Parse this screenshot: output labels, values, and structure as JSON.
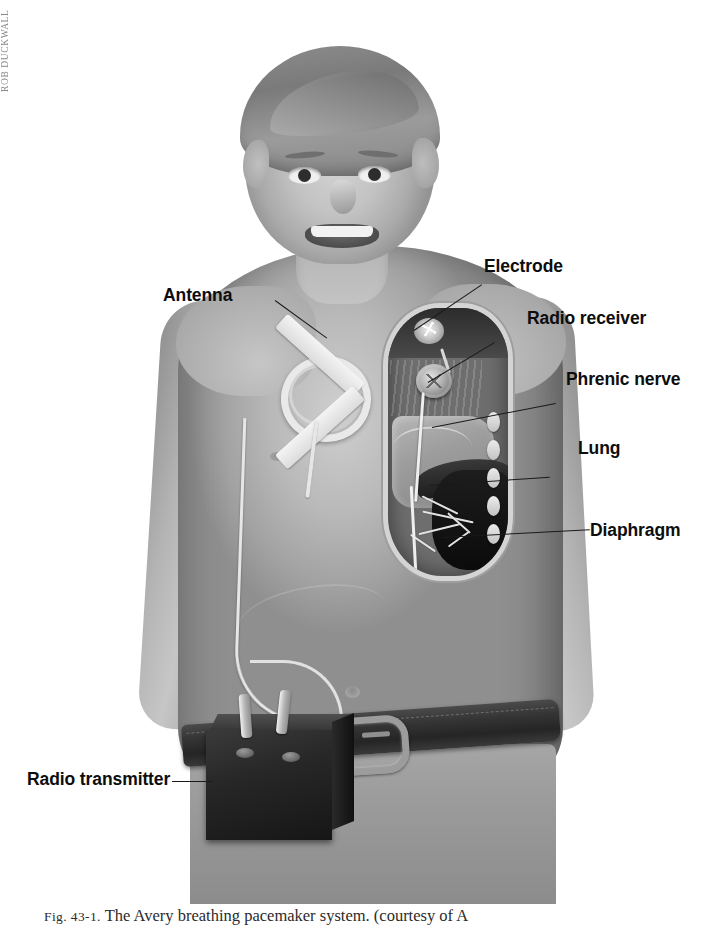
{
  "figure": {
    "alt_title": "Avery breathing pacemaker system",
    "caption_prefix": "Fig. 43-1.",
    "caption_text": "The Avery breathing pacemaker system. (courtesy of A",
    "artist_signature": "ROB DUCKWALL",
    "background_color": "#ffffff",
    "label_color": "#0d0d0d",
    "leader_color": "#1a1a1a"
  },
  "labels": [
    {
      "id": "antenna",
      "text": "Antenna",
      "side": "left"
    },
    {
      "id": "electrode",
      "text": "Electrode",
      "side": "right"
    },
    {
      "id": "radio-receiver",
      "text": "Radio receiver",
      "side": "right"
    },
    {
      "id": "phrenic-nerve",
      "text": "Phrenic nerve",
      "side": "right"
    },
    {
      "id": "lung",
      "text": "Lung",
      "side": "right"
    },
    {
      "id": "diaphragm",
      "text": "Diaphragm",
      "side": "right"
    },
    {
      "id": "radio-transmitter",
      "text": "Radio transmitter",
      "side": "left"
    }
  ],
  "anatomy": {
    "subject": "child torso, anterior view",
    "cutaway": "right hemithorax window",
    "parts": [
      "head",
      "neck",
      "torso",
      "left arm",
      "right arm",
      "belt",
      "trousers"
    ]
  },
  "device_parts": {
    "antenna": "circular external antenna coil taped to chest",
    "lead_wire": "wire from antenna to transmitter",
    "receiver": "implanted radio receiver disc",
    "electrode": "phrenic nerve electrode",
    "transmitter": "belt-worn radio transmitter box"
  }
}
